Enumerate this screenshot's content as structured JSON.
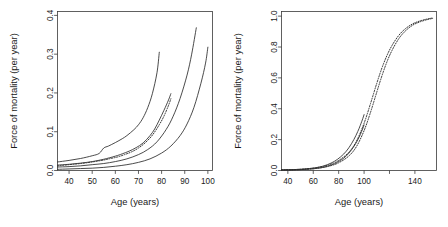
{
  "figure": {
    "title": "",
    "background": "#ffffff",
    "line_color": "#2b2b2b"
  },
  "chart_data": [
    {
      "type": "line",
      "panel": "left",
      "title": "",
      "xlabel": "Age (years)",
      "ylabel": "Force of mortality (per year)",
      "xlim": [
        35,
        102
      ],
      "ylim": [
        0.0,
        0.41
      ],
      "xticks": [
        40,
        50,
        60,
        70,
        80,
        90,
        100
      ],
      "xticklabels": [
        "40",
        "50",
        "60",
        "70",
        "80",
        "90",
        "100"
      ],
      "yticks": [
        0.0,
        0.1,
        0.2,
        0.3,
        0.4
      ],
      "yticklabels": [
        "0.0",
        "0.1",
        "0.2",
        "0.3",
        "0.4"
      ],
      "grid": false,
      "legend": "none",
      "series": [
        {
          "name": "curve-1-upper-solid",
          "style": "solid",
          "x": [
            35,
            40,
            45,
            50,
            53,
            55,
            57,
            60,
            63,
            65,
            68,
            70,
            72,
            74,
            76,
            78,
            79
          ],
          "y": [
            0.022,
            0.026,
            0.031,
            0.038,
            0.044,
            0.058,
            0.063,
            0.072,
            0.082,
            0.09,
            0.105,
            0.118,
            0.136,
            0.162,
            0.198,
            0.252,
            0.305
          ]
        },
        {
          "name": "curve-2-solid",
          "style": "solid",
          "x": [
            35,
            40,
            45,
            50,
            55,
            60,
            63,
            66,
            69,
            72,
            75,
            77,
            79,
            81,
            83,
            84
          ],
          "y": [
            0.014,
            0.016,
            0.019,
            0.023,
            0.029,
            0.037,
            0.043,
            0.05,
            0.059,
            0.071,
            0.09,
            0.107,
            0.13,
            0.155,
            0.182,
            0.198
          ]
        },
        {
          "name": "curve-2-dotted-overlay",
          "style": "dotted",
          "x": [
            35,
            40,
            45,
            50,
            55,
            58,
            61,
            64,
            67,
            70,
            73,
            76,
            79,
            81,
            83,
            84
          ],
          "y": [
            0.012,
            0.015,
            0.018,
            0.022,
            0.027,
            0.031,
            0.035,
            0.041,
            0.048,
            0.058,
            0.072,
            0.091,
            0.118,
            0.14,
            0.168,
            0.185
          ]
        },
        {
          "name": "curve-3-solid",
          "style": "solid",
          "x": [
            35,
            40,
            45,
            50,
            55,
            60,
            65,
            70,
            74,
            78,
            82,
            85,
            88,
            91,
            93,
            95
          ],
          "y": [
            0.009,
            0.01,
            0.012,
            0.015,
            0.018,
            0.023,
            0.03,
            0.041,
            0.054,
            0.074,
            0.106,
            0.14,
            0.186,
            0.246,
            0.3,
            0.368
          ]
        },
        {
          "name": "curve-4-lower-solid",
          "style": "solid",
          "x": [
            35,
            40,
            45,
            50,
            55,
            60,
            65,
            70,
            75,
            80,
            84,
            88,
            91,
            94,
            97,
            99,
            100
          ],
          "y": [
            0.003,
            0.004,
            0.005,
            0.006,
            0.008,
            0.011,
            0.015,
            0.021,
            0.03,
            0.045,
            0.063,
            0.09,
            0.12,
            0.163,
            0.225,
            0.277,
            0.318
          ]
        }
      ]
    },
    {
      "type": "line",
      "panel": "right",
      "title": "",
      "xlabel": "Age (years)",
      "ylabel": "Force of mortality (per year)",
      "xlim": [
        35,
        157
      ],
      "ylim": [
        0.0,
        1.03
      ],
      "xticks": [
        40,
        60,
        80,
        100,
        120,
        140
      ],
      "xticklabels": [
        "40",
        "60",
        "80",
        "100",
        "",
        "140"
      ],
      "yticks": [
        0.0,
        0.2,
        0.4,
        0.6,
        0.8,
        1.0
      ],
      "yticklabels": [
        "0.0",
        "0.2",
        "0.4",
        "0.6",
        "0.8",
        "1.0"
      ],
      "grid": false,
      "legend": "none",
      "series": [
        {
          "name": "curve-a-solid",
          "style": "solid",
          "x": [
            35,
            45,
            55,
            62,
            68,
            74,
            79,
            84,
            88,
            92,
            95,
            97,
            99,
            100
          ],
          "y": [
            0.004,
            0.006,
            0.011,
            0.018,
            0.029,
            0.048,
            0.072,
            0.107,
            0.147,
            0.201,
            0.252,
            0.292,
            0.337,
            0.362
          ]
        },
        {
          "name": "curve-b-solid",
          "style": "solid",
          "x": [
            35,
            45,
            55,
            62,
            68,
            74,
            79,
            84,
            88,
            92,
            95,
            97,
            99,
            100
          ],
          "y": [
            0.003,
            0.004,
            0.008,
            0.013,
            0.021,
            0.035,
            0.053,
            0.08,
            0.112,
            0.156,
            0.198,
            0.232,
            0.272,
            0.295
          ]
        },
        {
          "name": "curve-a-dotted",
          "style": "dotted",
          "x": [
            35,
            50,
            62,
            72,
            80,
            88,
            94,
            100,
            105,
            110,
            114,
            118,
            122,
            127,
            132,
            138,
            144,
            150,
            154
          ],
          "y": [
            0.004,
            0.008,
            0.018,
            0.036,
            0.065,
            0.118,
            0.19,
            0.306,
            0.432,
            0.565,
            0.663,
            0.745,
            0.81,
            0.872,
            0.915,
            0.949,
            0.969,
            0.982,
            0.988
          ]
        },
        {
          "name": "curve-b-dotted",
          "style": "dotted",
          "x": [
            35,
            50,
            62,
            72,
            80,
            88,
            94,
            100,
            105,
            110,
            114,
            118,
            122,
            127,
            132,
            138,
            144,
            150,
            154
          ],
          "y": [
            0.003,
            0.006,
            0.013,
            0.027,
            0.05,
            0.094,
            0.155,
            0.258,
            0.375,
            0.508,
            0.612,
            0.704,
            0.778,
            0.85,
            0.9,
            0.94,
            0.963,
            0.978,
            0.985
          ]
        }
      ]
    }
  ]
}
